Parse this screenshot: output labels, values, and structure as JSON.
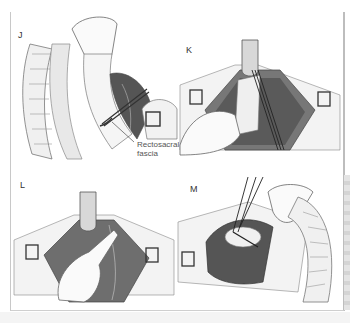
{
  "figure": {
    "panels": [
      {
        "letter": "J",
        "description": "Retraction of rectum with scissors dividing rectosacral fascia"
      },
      {
        "letter": "K",
        "description": "Retractor and long instrument in pelvic dissection with hand"
      },
      {
        "letter": "L",
        "description": "Retractor with hand finger dissection in pelvis"
      },
      {
        "letter": "M",
        "description": "Forceps grasping tissue beside colon"
      }
    ],
    "annotation": {
      "line1": "Rectosacral",
      "line2": "fascia"
    },
    "colors": {
      "tissue_dark": "#4a4a4a",
      "tissue_mid": "#8a8a8a",
      "tissue_light": "#e6e6e6",
      "outline": "#6e6e6e",
      "frame": "#c8c8c8"
    }
  }
}
